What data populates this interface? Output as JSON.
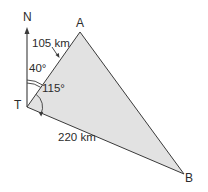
{
  "diagram": {
    "type": "bearing-triangle",
    "points": {
      "T": {
        "label": "T",
        "x": 27,
        "y": 107
      },
      "A": {
        "label": "A",
        "x": 80,
        "y": 32
      },
      "B": {
        "label": "B",
        "x": 184,
        "y": 174
      }
    },
    "north": {
      "label": "N"
    },
    "sides": {
      "TA": {
        "label": "105 km"
      },
      "TB": {
        "label": "220 km"
      }
    },
    "angles": {
      "north_to_A": {
        "label": "40°"
      },
      "A_to_B": {
        "label": "115°"
      }
    },
    "colors": {
      "fill": "#e2e2e2",
      "stroke": "#3a3a3a",
      "text": "#2b2b2b"
    }
  }
}
